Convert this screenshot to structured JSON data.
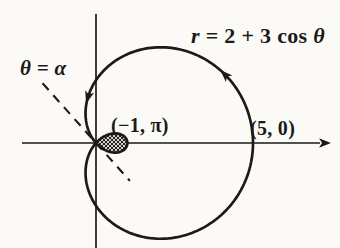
{
  "figure": {
    "background": "#fbfaf7",
    "ink": "#1c1a17",
    "hatch_fill": "#d8d4cc"
  },
  "labels": {
    "equation": {
      "r_var": "r",
      "equals_terms": " = 2 + 3 ",
      "cos_fn": "cos ",
      "theta_var": "θ"
    },
    "ray_angle": "θ = α",
    "inner_loop_point": "(−1, π)",
    "x_intercept_point": "(5, 0)"
  },
  "chart_data": {
    "type": "line",
    "coordinate_system": "polar",
    "equation": "r = 2 + 3 cos θ",
    "polar_params": {
      "a": 2,
      "b": 3
    },
    "theta_range_deg": [
      0,
      360
    ],
    "key_points": [
      {
        "polar_label": "(5, 0)",
        "r": 5,
        "theta_deg": 0,
        "cartesian": [
          5,
          0
        ]
      },
      {
        "polar_label": "(−1, π)",
        "r": -1,
        "theta_deg": 180,
        "cartesian": [
          1,
          0
        ]
      }
    ],
    "inner_loop_theta_deg": [
      131.81,
      228.19
    ],
    "inner_loop_shaded": true,
    "tangent_ray": {
      "label": "θ = α",
      "alpha_deg": 131.8,
      "r_from": 2.55,
      "r_to": -1.62,
      "dashed": true
    },
    "direction_arrows_theta_deg": [
      28,
      100
    ],
    "pole_px": {
      "x": 96,
      "y": 143
    },
    "scale_px_per_unit": 31.4,
    "axes_px": {
      "x_from": 22,
      "x_to": 320,
      "x_arrow_tip": 331,
      "y_from": 14,
      "y_to": 248
    },
    "grid": false,
    "axis_ticks": "none"
  }
}
